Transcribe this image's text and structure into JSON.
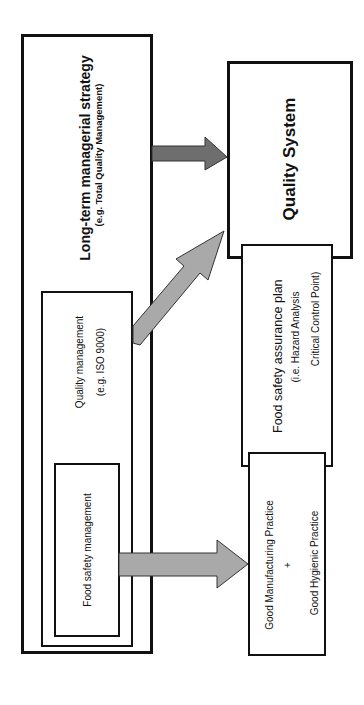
{
  "diagram": {
    "orientation": "rotated -90deg",
    "nodes": {
      "long_term": {
        "title": "Long-term managerial strategy",
        "subtitle": "(e.g. Total Quality Management)"
      },
      "quality_management": {
        "title": "Quality management",
        "subtitle": "(e.g. ISO 9000)"
      },
      "food_safety_management": {
        "title": "Food safety management"
      },
      "quality_system": {
        "title": "Quality System"
      },
      "food_safety_plan": {
        "title": "Food safety assurance plan",
        "line2": "(i.e. Hazard Analysis",
        "line3": "Critical Control Point)"
      },
      "gmp": {
        "line1": "Good Manufacturing Practice",
        "plus": "+",
        "line2": "Good Hygienic Practice"
      }
    },
    "edges": [
      {
        "from": "Long-term managerial strategy",
        "to": "Quality System",
        "color": "#6e6e6e"
      },
      {
        "from": "Quality management",
        "to": "Quality System",
        "color": "#a9a9a9"
      },
      {
        "from": "Food safety management",
        "to": "Good Manufacturing Practice + Good Hygienic Practice",
        "color": "#a9a9a9"
      }
    ],
    "colors": {
      "border": "#111111",
      "arrow_dark": "#6e6e6e",
      "arrow_light": "#a9a9a9",
      "arrow_stroke": "#333333"
    }
  }
}
